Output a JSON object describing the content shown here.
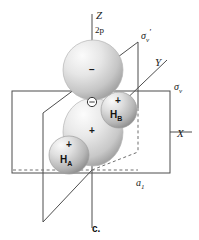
{
  "figure": {
    "caption": "c."
  },
  "axes": [
    {
      "key": "z",
      "label": "Z"
    },
    {
      "key": "y",
      "label": "Y"
    },
    {
      "key": "x",
      "label": "X"
    }
  ],
  "orbital": {
    "type_label": "2p",
    "top_lobe_sign": "−",
    "bottom_lobe_sign": "+",
    "center_atom_symbol": "⊖"
  },
  "hydrogens": [
    {
      "key": "ha",
      "label": "H",
      "subscript": "A",
      "sign": "+"
    },
    {
      "key": "hb",
      "label": "H",
      "subscript": "B",
      "sign": "+"
    }
  ],
  "mirror_planes": [
    {
      "key": "sigma_v_prime",
      "symbol": "σ",
      "subscript": "v",
      "prime": "′"
    },
    {
      "key": "sigma_v",
      "symbol": "σ",
      "subscript": "v",
      "prime": ""
    }
  ],
  "symmetry": {
    "irreducible_representation": "a",
    "irrep_subscript": "1"
  },
  "colors": {
    "background": "#ffffff",
    "line": "#4d4d4d",
    "dashed_line": "#6e6e6e",
    "text": "#1a1a1a",
    "lobe_light": "#f2f2f2",
    "lobe_mid": "#cfcfcf",
    "lobe_dark": "#9a9a9a"
  }
}
